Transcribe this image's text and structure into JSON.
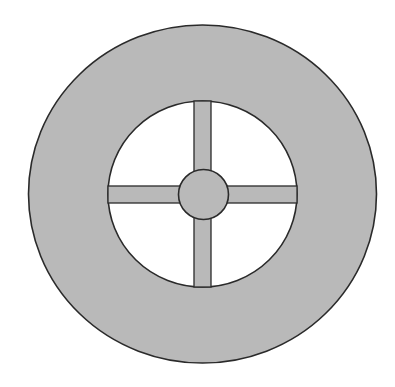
{
  "diagram": {
    "title": "",
    "background": "#ffffff",
    "fill_color": "#b9b9b9",
    "stroke_color": "#2a2a2a",
    "shapes": {
      "outer_disc": {
        "cx": 202.5,
        "cy": 194,
        "rx": 174,
        "ry": 169
      },
      "inner_hole": {
        "cx": 202.5,
        "cy": 194,
        "rx": 94.5,
        "ry": 93
      },
      "vertical_spoke": {
        "x": 194,
        "y": 101,
        "width": 17,
        "height": 186
      },
      "horizontal_spoke": {
        "x": 108,
        "y": 186,
        "width": 189,
        "height": 17
      },
      "hub": {
        "cx": 203.5,
        "cy": 194.5,
        "r": 25
      }
    },
    "labels": []
  }
}
